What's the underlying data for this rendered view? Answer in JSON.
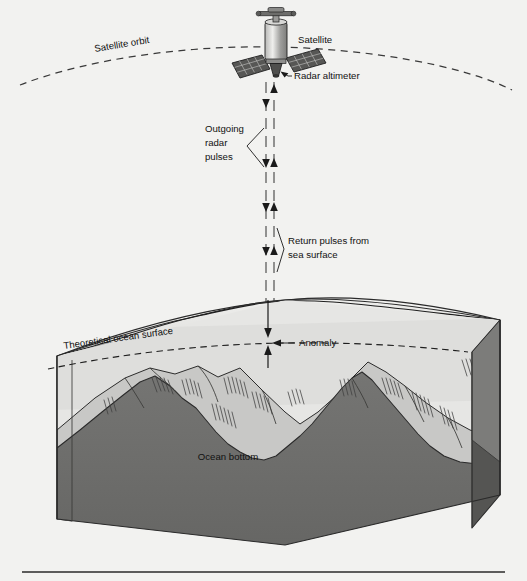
{
  "figure": {
    "background_color": "#f2f2f0"
  },
  "labels": {
    "satellite_orbit": "Satellite orbit",
    "satellite": "Satellite",
    "radar_altimeter": "Radar altimeter",
    "outgoing_pulses_line1": "Outgoing",
    "outgoing_pulses_line2": "radar",
    "outgoing_pulses_line3": "pulses",
    "return_pulses_line1": "Return pulses from",
    "return_pulses_line2": "sea surface",
    "theoretical_ocean_surface": "Theoretical ocean surface",
    "anomaly": "Anomaly",
    "ocean_bottom": "Ocean bottom"
  },
  "colors": {
    "paper": "#f2f2f0",
    "ink": "#1a1a1a",
    "water_light": "#e8e8e6",
    "water_shade": "#dcdcda",
    "slope_mid": "#c6c6c4",
    "rock_dark": "#6e6e6e",
    "rock_side": "#565656",
    "block_face_light": "#d9d9d7"
  },
  "elements": {
    "orbit_style": "dashed-arc",
    "pulse_down_icon": "arrow-down",
    "pulse_up_icon": "arrow-up",
    "anomaly_icon": "double-arrow-vertical",
    "satellite_icon": "satellite-with-solar-panels"
  }
}
